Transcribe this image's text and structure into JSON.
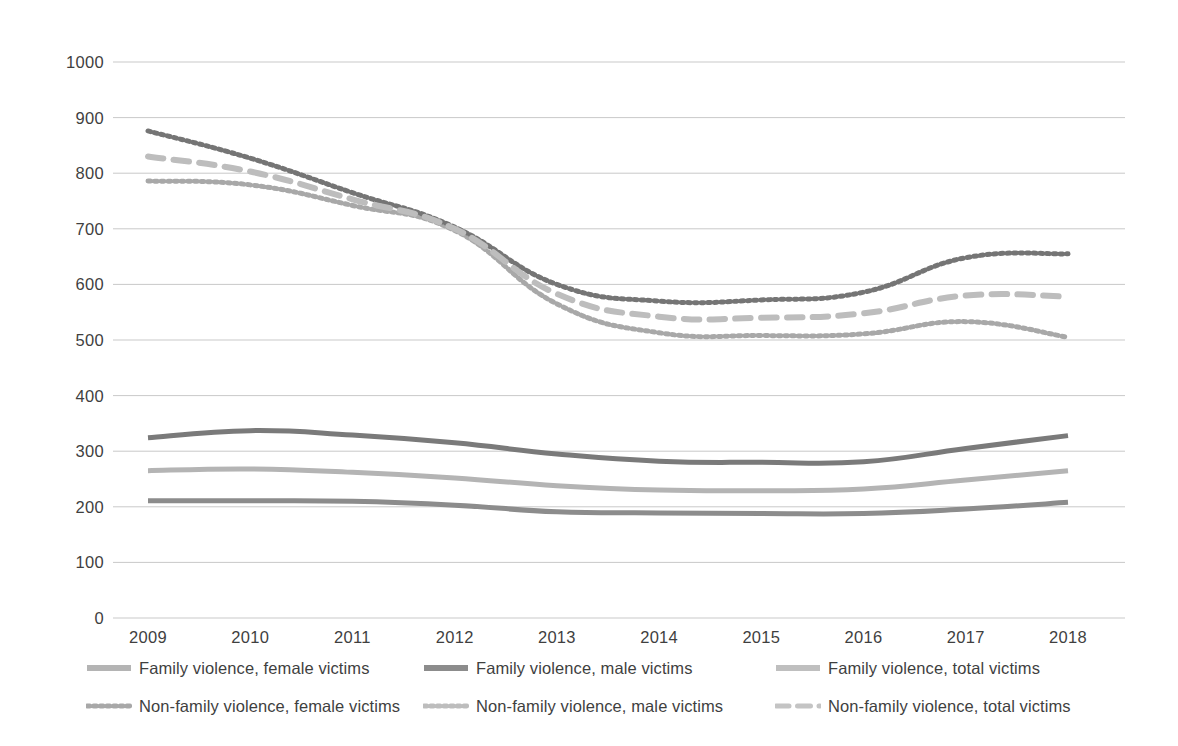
{
  "chart_data": {
    "type": "line",
    "title": "",
    "subtitle": "",
    "xlabel": "",
    "ylabel": "",
    "xlim": [
      2009,
      2018
    ],
    "ylim": [
      0,
      1000
    ],
    "ytick_step": 100,
    "grid": "horizontal",
    "legend_position": "bottom",
    "x": [
      2009,
      2010,
      2011,
      2012,
      2013,
      2014,
      2015,
      2016,
      2017,
      2018
    ],
    "ytick_labels": [
      "1000",
      "900",
      "800",
      "700",
      "600",
      "500",
      "400",
      "300",
      "200",
      "100",
      "0"
    ],
    "xtick_labels": [
      "2009",
      "2010",
      "2011",
      "2012",
      "2013",
      "2014",
      "2015",
      "2016",
      "2017",
      "2018"
    ],
    "series": [
      {
        "name": "Family violence, female victims",
        "style": "solid",
        "color": "#b4b4b4",
        "width": 5,
        "values": [
          265,
          268,
          262,
          252,
          238,
          230,
          229,
          232,
          248,
          265
        ]
      },
      {
        "name": "Family violence, male victims",
        "style": "solid",
        "color": "#8c8c8c",
        "width": 5,
        "values": [
          211,
          211,
          210,
          203,
          191,
          189,
          188,
          188,
          196,
          208
        ]
      },
      {
        "name": "Family violence, total victims",
        "style": "solid",
        "color": "#7a7a7a",
        "width": 5,
        "values": [
          324,
          337,
          329,
          315,
          295,
          282,
          280,
          281,
          305,
          328
        ]
      },
      {
        "name": "Non-family violence, female victims",
        "style": "dotted",
        "color": "#a8a8a8",
        "width": 5,
        "values": [
          786,
          779,
          742,
          697,
          565,
          513,
          508,
          511,
          533,
          505
        ]
      },
      {
        "name": "Non-family violence, male victims",
        "style": "dotted",
        "color": "#757575",
        "width": 5,
        "values": [
          876,
          827,
          765,
          703,
          600,
          570,
          572,
          586,
          648,
          655
        ]
      },
      {
        "name": "Non-family violence, total victims",
        "style": "dashed",
        "color": "#bdbdbd",
        "width": 6,
        "values": [
          830,
          803,
          753,
          700,
          583,
          542,
          540,
          548,
          580,
          578
        ]
      }
    ]
  },
  "legend": {
    "row1": [
      {
        "label": "Family violence, female victims",
        "style": "solid",
        "color": "#b4b4b4"
      },
      {
        "label": "Family violence, male victims",
        "style": "solid",
        "color": "#8c8c8c"
      },
      {
        "label": "Family violence, total victims",
        "style": "solid",
        "color": "#bfbfbf"
      }
    ],
    "row2": [
      {
        "label": "Non-family violence, female victims",
        "style": "dotted",
        "color": "#a8a8a8"
      },
      {
        "label": "Non-family violence, male victims",
        "style": "dotted",
        "color": "#bdbdbd"
      },
      {
        "label": "Non-family violence, total victims",
        "style": "dashed",
        "color": "#c4c4c4"
      }
    ]
  },
  "colors": {
    "gridline": "#c9c9c9",
    "background": "#ffffff",
    "text": "#3f3f3f"
  }
}
